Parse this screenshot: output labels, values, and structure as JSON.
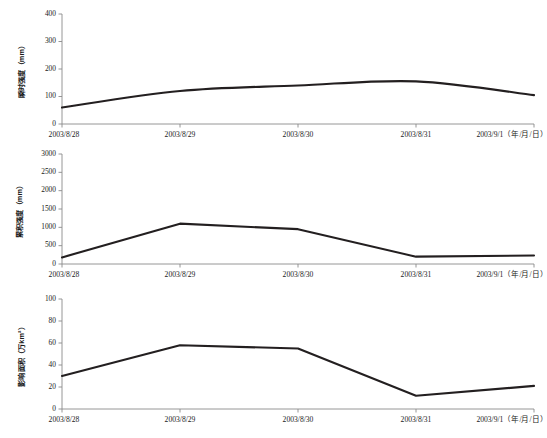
{
  "figure": {
    "panel_count": 3,
    "background": "#ffffff",
    "line_color": "#231f20",
    "axis_color": "#8a8a8a"
  },
  "chart_data": [
    {
      "type": "line",
      "title": "",
      "xlabel": "",
      "ylabel": "瞬时强度（mm）",
      "categories": [
        "2003/8/28",
        "2003/8/29",
        "2003/8/30",
        "2003/8/31",
        "2003/9/1（年/月/日）"
      ],
      "x_tick_labels": [
        "2003/8/28",
        "2003/8/29",
        "2003/8/30",
        "2003/8/31",
        "2003/9/1（年/月/日）"
      ],
      "values": [
        60,
        120,
        140,
        155,
        105
      ],
      "ylim": [
        0,
        400
      ],
      "y_tick_labels": [
        "0",
        "100",
        "200",
        "300",
        "400"
      ],
      "y_ticks": [
        0,
        100,
        200,
        300,
        400
      ],
      "grid": false,
      "legend": "none",
      "smooth": true
    },
    {
      "type": "line",
      "title": "",
      "xlabel": "",
      "ylabel": "累积强度（mm）",
      "categories": [
        "2003/8/28",
        "2003/8/29",
        "2003/8/30",
        "2003/8/31",
        "2003/9/1（年/月/日）"
      ],
      "x_tick_labels": [
        "2003/8/28",
        "2003/8/29",
        "2003/8/30",
        "2003/8/31",
        "2003/9/1（年/月/日）"
      ],
      "values": [
        180,
        1100,
        950,
        200,
        230
      ],
      "ylim": [
        0,
        3000
      ],
      "y_tick_labels": [
        "0",
        "500",
        "1000",
        "1500",
        "2000",
        "2500",
        "3000"
      ],
      "y_ticks": [
        0,
        500,
        1000,
        1500,
        2000,
        2500,
        3000
      ],
      "grid": false,
      "legend": "none",
      "smooth": false
    },
    {
      "type": "line",
      "title": "",
      "xlabel": "",
      "ylabel": "影响面积（万km²）",
      "categories": [
        "2003/8/28",
        "2003/8/29",
        "2003/8/30",
        "2003/8/31",
        "2003/9/1（年/月/日）"
      ],
      "x_tick_labels": [
        "2003/8/28",
        "2003/8/29",
        "2003/8/30",
        "2003/8/31",
        "2003/9/1（年/月/日）"
      ],
      "values": [
        30,
        58,
        55,
        12,
        21
      ],
      "ylim": [
        0,
        100
      ],
      "y_tick_labels": [
        "0",
        "20",
        "40",
        "60",
        "80",
        "100"
      ],
      "y_ticks": [
        0,
        20,
        40,
        60,
        80,
        100
      ],
      "grid": false,
      "legend": "none",
      "smooth": false
    }
  ]
}
